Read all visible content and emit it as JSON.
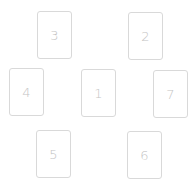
{
  "layout": {
    "title": "Card spread",
    "cards": [
      {
        "position": "1",
        "label": "1",
        "x": 81,
        "y": 69
      },
      {
        "position": "2",
        "label": "2",
        "x": 128,
        "y": 12
      },
      {
        "position": "3",
        "label": "3",
        "x": 37,
        "y": 11
      },
      {
        "position": "4",
        "label": "4",
        "x": 9,
        "y": 68
      },
      {
        "position": "5",
        "label": "5",
        "x": 36,
        "y": 130
      },
      {
        "position": "6",
        "label": "6",
        "x": 127,
        "y": 131
      },
      {
        "position": "7",
        "label": "7",
        "x": 153,
        "y": 70
      }
    ]
  },
  "colors": {
    "border": "#d9d9d9",
    "text": "#c4c4c4",
    "background": "#ffffff"
  }
}
